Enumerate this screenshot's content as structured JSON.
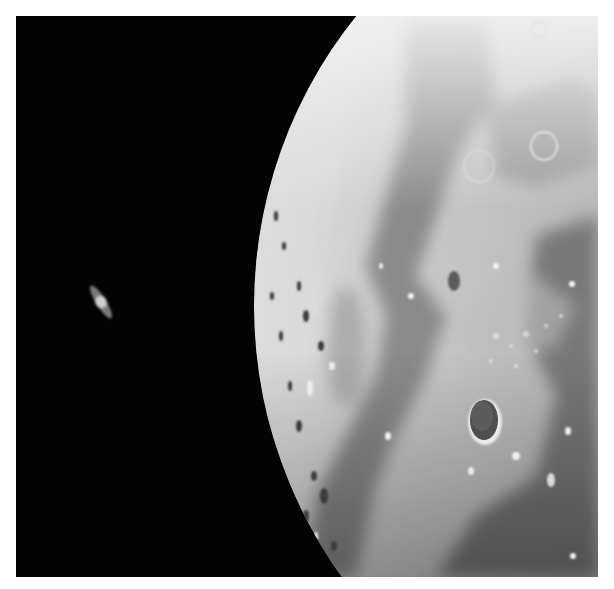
{
  "image": {
    "subject": "Saturn beside the lunar limb",
    "description": "Telescopic photograph: small ringed planet Saturn on black sky at left, large gibbous Moon filling the right side with craters and maria",
    "colors": {
      "background": "#ffffff",
      "sky": "#030303",
      "highland": "#c8c8c8",
      "limb_bright": "#e6e6e6",
      "mare": "#7c7c7c",
      "mare_dark": "#6a6a6a",
      "crater_floor": "#555555",
      "saturn": "#bdbdbd"
    },
    "objects": [
      {
        "name": "Saturn",
        "position": {
          "x": 100,
          "y": 302
        }
      },
      {
        "name": "Moon",
        "limb_points": [
          {
            "x": 293,
            "y": 16
          },
          {
            "x": 255,
            "y": 300
          },
          {
            "x": 318,
            "y": 577
          }
        ]
      },
      {
        "name": "Large dark-floored crater",
        "position": {
          "x": 485,
          "y": 422
        }
      }
    ]
  }
}
